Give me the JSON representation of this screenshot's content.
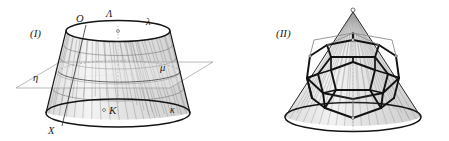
{
  "plate": {
    "background": "#ffffff",
    "width": 449,
    "height": 141
  },
  "figures": [
    {
      "id": "figure-one",
      "caption": "(I)",
      "subject": "truncated-cone-frustum-cut-by-plane",
      "labels": [
        {
          "name": "label-O",
          "text": "O",
          "x": 76,
          "y": 22,
          "style": "italic-latin"
        },
        {
          "name": "label-Lambda",
          "text": "Λ",
          "x": 106,
          "y": 17,
          "style": "italic-greek"
        },
        {
          "name": "label-lambda",
          "text": "λ",
          "x": 146,
          "y": 23,
          "style": "italic-greek"
        },
        {
          "name": "label-eta",
          "text": "η",
          "x": 33,
          "y": 78,
          "style": "italic-greek"
        },
        {
          "name": "label-mu",
          "text": "μ",
          "x": 160,
          "y": 68,
          "style": "italic-greek"
        },
        {
          "name": "label-X",
          "text": "X",
          "x": 48,
          "y": 131,
          "style": "italic-latin"
        },
        {
          "name": "label-K",
          "text": "K",
          "x": 111,
          "y": 111,
          "style": "italic-latin"
        },
        {
          "name": "label-kappa",
          "text": "κ",
          "x": 172,
          "y": 110,
          "style": "italic-greek"
        }
      ],
      "colors": {
        "outline": "#1a1a1a",
        "meridian": "#8c8c8c",
        "parallel": "#6e6e6e",
        "plane": "#9a9a9a",
        "axis": "#a8a8a8",
        "surface": "#f0f0f0"
      }
    },
    {
      "id": "figure-two",
      "caption": "(II)",
      "subject": "dodecahedron-inscribed-in-cone",
      "labels": [
        {
          "name": "label-fig-two",
          "text": "(II)",
          "x": 276,
          "y": 33,
          "style": "italic-latin"
        }
      ],
      "colors": {
        "outline": "#1a1a1a",
        "polyhedron": "#111111",
        "ruling": "#9a9a9a",
        "axis": "#b0b0b0",
        "surface": "#ededed"
      }
    }
  ]
}
